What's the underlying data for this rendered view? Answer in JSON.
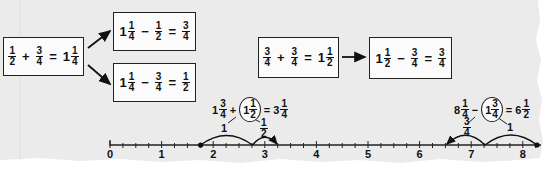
{
  "colors": {
    "paper": "#ebebeb",
    "ink": "#1a1a1a",
    "edge": "#ffffff"
  },
  "boxes": {
    "a": {
      "f1": {
        "num": "1",
        "den": "2"
      },
      "op1": "+",
      "f2": {
        "num": "3",
        "den": "4"
      },
      "eq": "=",
      "res_whole": "1",
      "res": {
        "num": "1",
        "den": "4"
      }
    },
    "b": {
      "whole": "1",
      "f1": {
        "num": "1",
        "den": "4"
      },
      "op1": "−",
      "f2": {
        "num": "1",
        "den": "2"
      },
      "eq": "=",
      "res": {
        "num": "3",
        "den": "4"
      }
    },
    "c": {
      "whole": "1",
      "f1": {
        "num": "1",
        "den": "4"
      },
      "op1": "−",
      "f2": {
        "num": "3",
        "den": "4"
      },
      "eq": "=",
      "res": {
        "num": "1",
        "den": "2"
      }
    },
    "d": {
      "f1": {
        "num": "3",
        "den": "4"
      },
      "op1": "+",
      "f2": {
        "num": "3",
        "den": "4"
      },
      "eq": "=",
      "res_whole": "1",
      "res": {
        "num": "1",
        "den": "2"
      }
    },
    "e": {
      "whole": "1",
      "f1": {
        "num": "1",
        "den": "2"
      },
      "op1": "−",
      "f2": {
        "num": "3",
        "den": "4"
      },
      "eq": "=",
      "res": {
        "num": "3",
        "den": "4"
      }
    }
  },
  "addition_example": {
    "a_whole": "1",
    "a": {
      "num": "3",
      "den": "4"
    },
    "op": "+",
    "b_whole": "1",
    "b": {
      "num": "1",
      "den": "2"
    },
    "eq": "=",
    "r_whole": "3",
    "r": {
      "num": "1",
      "den": "4"
    },
    "split_left": "1",
    "split_right": {
      "num": "1",
      "den": "2"
    }
  },
  "subtraction_example": {
    "a_whole": "8",
    "a": {
      "num": "1",
      "den": "4"
    },
    "op": "−",
    "b_whole": "1",
    "b": {
      "num": "3",
      "den": "4"
    },
    "eq": "=",
    "r_whole": "6",
    "r": {
      "num": "1",
      "den": "2"
    },
    "split_left": {
      "num": "3",
      "den": "4"
    },
    "split_right": "1"
  },
  "number_line": {
    "labels": [
      "0",
      "1",
      "2",
      "3",
      "4",
      "5",
      "6",
      "7",
      "8"
    ],
    "min": 0,
    "max": 8,
    "tick_step": 0.25
  }
}
